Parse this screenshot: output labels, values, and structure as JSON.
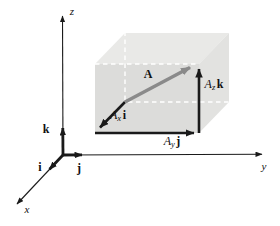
{
  "figure": {
    "axes": {
      "x": "x",
      "y": "y",
      "z": "z"
    },
    "unit_vectors": {
      "i": "i",
      "j": "j",
      "k": "k"
    },
    "vector_label": "A",
    "components": {
      "x": {
        "coeff": "A",
        "sub": "x",
        "unit": "i"
      },
      "y": {
        "coeff": "A",
        "sub": "y",
        "unit": "j"
      },
      "z": {
        "coeff": "A",
        "sub": "z",
        "unit": "k"
      }
    },
    "colors": {
      "box_top": "#e9e9e7",
      "box_front": "#dcdcda",
      "box_right": "#e2e2e0",
      "hidden_edge": "#ffffff",
      "vector": "#8a8a8a",
      "ink": "#1a1a1a"
    }
  }
}
